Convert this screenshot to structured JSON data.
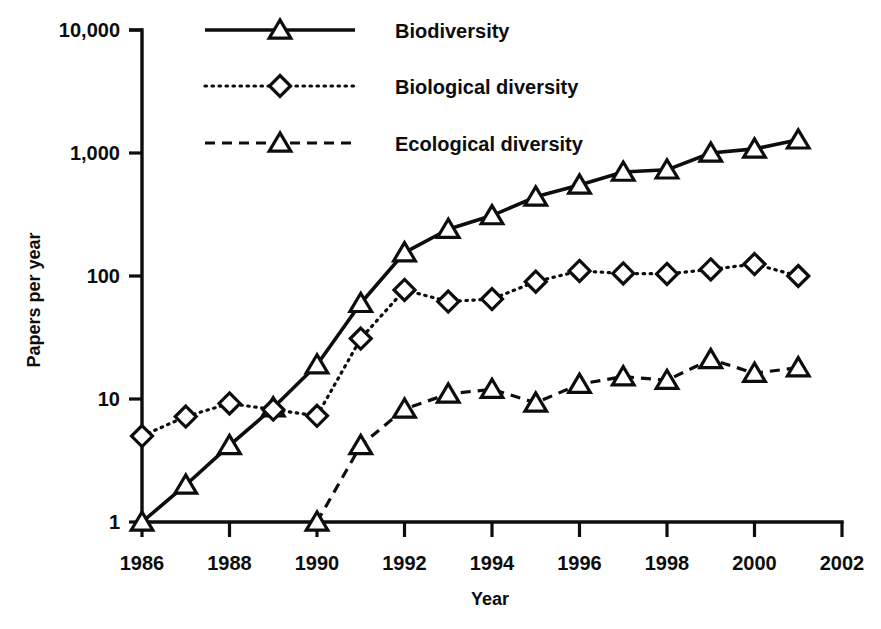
{
  "chart_data": {
    "type": "line",
    "title": "",
    "xlabel": "Year",
    "ylabel": "Papers per year",
    "yscale": "log",
    "ylim": [
      1,
      10000
    ],
    "xlim": [
      1986,
      2002
    ],
    "grid": false,
    "legend_position": "top-center",
    "y_tick_labels": [
      "10,000",
      "1,000",
      "100",
      "10",
      "1"
    ],
    "y_tick_values": [
      10000,
      1000,
      100,
      10,
      1
    ],
    "x_tick_labels": [
      "1986",
      "1988",
      "1990",
      "1992",
      "1994",
      "1996",
      "1998",
      "2000",
      "2002"
    ],
    "x_tick_values": [
      1986,
      1988,
      1990,
      1992,
      1994,
      1996,
      1998,
      2000,
      2002
    ],
    "x": [
      1986,
      1987,
      1988,
      1989,
      1990,
      1991,
      1992,
      1993,
      1994,
      1995,
      1996,
      1997,
      1998,
      1999,
      2000,
      2001
    ],
    "series": [
      {
        "name": "Biodiversity",
        "marker": "triangle",
        "linestyle": "solid",
        "x": [
          1986,
          1987,
          1988,
          1989,
          1990,
          1991,
          1992,
          1993,
          1994,
          1995,
          1996,
          1997,
          1998,
          1999,
          2000,
          2001
        ],
        "values": [
          1,
          2,
          4.2,
          8.5,
          19,
          60,
          155,
          240,
          310,
          440,
          550,
          700,
          730,
          1000,
          1080,
          1280
        ]
      },
      {
        "name": "Biological diversity",
        "marker": "diamond",
        "linestyle": "dotted",
        "x": [
          1986,
          1987,
          1988,
          1989,
          1990,
          1991,
          1992,
          1993,
          1994,
          1995,
          1996,
          1997,
          1998,
          1999,
          2000,
          2001
        ],
        "values": [
          5,
          7.2,
          9.2,
          8.2,
          7.3,
          31,
          77,
          62,
          65,
          90,
          110,
          105,
          104,
          113,
          125,
          100
        ]
      },
      {
        "name": "Ecological diversity",
        "marker": "triangle",
        "linestyle": "dashed",
        "x": [
          1990,
          1991,
          1992,
          1993,
          1994,
          1995,
          1996,
          1997,
          1998,
          1999,
          2000,
          2001
        ],
        "values": [
          1,
          4.2,
          8.3,
          11,
          12,
          9.3,
          13.2,
          15.2,
          14.2,
          21,
          16.2,
          18
        ]
      }
    ]
  },
  "axes": {
    "y_title": "Papers per year",
    "x_title": "Year",
    "y_ticks": [
      {
        "label": "10,000"
      },
      {
        "label": "1,000"
      },
      {
        "label": "100"
      },
      {
        "label": "10"
      },
      {
        "label": "1"
      }
    ],
    "x_ticks": [
      {
        "label": "1986"
      },
      {
        "label": "1988"
      },
      {
        "label": "1990"
      },
      {
        "label": "1992"
      },
      {
        "label": "1994"
      },
      {
        "label": "1996"
      },
      {
        "label": "1998"
      },
      {
        "label": "2000"
      },
      {
        "label": "2002"
      }
    ]
  },
  "legend": {
    "entries": [
      {
        "label": "Biodiversity",
        "marker": "triangle",
        "linestyle": "solid"
      },
      {
        "label": "Biological diversity",
        "marker": "diamond",
        "linestyle": "dotted"
      },
      {
        "label": "Ecological diversity",
        "marker": "triangle",
        "linestyle": "dashed"
      }
    ]
  },
  "colors": {
    "ink": "#0d0d0d",
    "background": "#ffffff",
    "marker_fill": "#ffffff"
  }
}
